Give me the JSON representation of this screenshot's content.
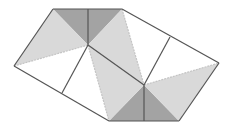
{
  "diagram": {
    "colors": {
      "dark": "#a3a3a3",
      "light": "#d9d9d9",
      "outline": "#555555",
      "dashed": "#c4c4c4",
      "background": "#ffffff"
    },
    "vertices": {
      "A": [
        53,
        9
      ],
      "B": [
        88,
        9
      ],
      "C": [
        122,
        9
      ],
      "P": [
        88,
        45
      ],
      "L": [
        14,
        66
      ],
      "M": [
        62,
        93
      ],
      "D": [
        109,
        121
      ],
      "E": [
        144,
        121
      ],
      "F": [
        179,
        121
      ],
      "Q": [
        144,
        85
      ],
      "R": [
        219,
        63
      ],
      "N": [
        170,
        37
      ]
    },
    "regions": [
      {
        "name": "dark-top-left-triangle",
        "shade": "dark",
        "points": [
          "A",
          "B",
          "P"
        ]
      },
      {
        "name": "dark-top-right-triangle",
        "shade": "dark",
        "points": [
          "B",
          "C",
          "P"
        ]
      },
      {
        "name": "dark-bottom-left-triangle",
        "shade": "dark",
        "points": [
          "D",
          "E",
          "Q"
        ]
      },
      {
        "name": "dark-bottom-right-triangle",
        "shade": "dark",
        "points": [
          "E",
          "F",
          "Q"
        ]
      },
      {
        "name": "light-left-triangle",
        "shade": "light",
        "points": [
          "A",
          "P",
          "L"
        ]
      },
      {
        "name": "light-center-band",
        "shade": "light",
        "points": [
          "P",
          "C",
          "Q",
          "D"
        ]
      },
      {
        "name": "light-right-triangle",
        "shade": "light",
        "points": [
          "Q",
          "R",
          "F"
        ]
      }
    ]
  }
}
